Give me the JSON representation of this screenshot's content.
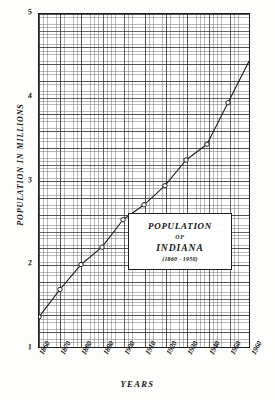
{
  "chart_data": {
    "type": "line",
    "title": "POPULATION",
    "title_connector": "OF",
    "subtitle": "INDIANA",
    "range_label": "(1860 - 1950)",
    "xlabel": "YEARS",
    "ylabel": "POPULATION IN MILLIONS",
    "xlim": [
      1860,
      1960
    ],
    "ylim": [
      1,
      5
    ],
    "grid": true,
    "legend": "none",
    "marker": "open-circle",
    "x": [
      1860,
      1870,
      1880,
      1890,
      1900,
      1910,
      1920,
      1930,
      1940,
      1950
    ],
    "values": [
      1.35,
      1.68,
      1.98,
      2.19,
      2.52,
      2.7,
      2.93,
      3.24,
      3.43,
      3.93
    ],
    "categories": [
      "1860",
      "1870",
      "1880",
      "1890",
      "1900",
      "1910",
      "1920",
      "1930",
      "1940",
      "1950"
    ],
    "yticks": [
      1,
      2,
      3,
      4,
      5
    ],
    "ytick_labels": [
      "1",
      "2",
      "3",
      "4",
      "5"
    ],
    "xticks": [
      1860,
      1870,
      1880,
      1890,
      1900,
      1910,
      1920,
      1930,
      1940,
      1950,
      1960
    ],
    "xtick_labels": [
      "1860",
      "1870",
      "1880",
      "1890",
      "1900",
      "1910",
      "1920",
      "1930",
      "1940",
      "1950",
      "1960"
    ],
    "series_name": "Indiana population",
    "line_color": "#1d1d1d",
    "grid_color": "#5a5a5a",
    "background_color": "#ffffff"
  }
}
